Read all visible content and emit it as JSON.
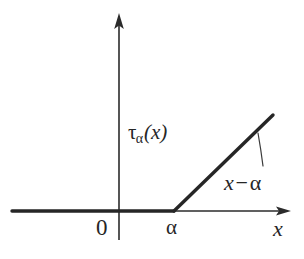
{
  "figure": {
    "kind": "hand-drawn mathematical plot",
    "background_color": "#ffffff",
    "ink_color": "#262626"
  },
  "labels": {
    "function_name": "τ",
    "function_subscript": "α",
    "function_argument": "(x)",
    "annotation_lhs": "x",
    "annotation_operator": "−",
    "annotation_rhs": "α",
    "origin": "0",
    "alpha_tick": "α",
    "x_axis": "x"
  },
  "chart_data": {
    "type": "line",
    "title": "",
    "xlabel": "x",
    "ylabel": "τα(x)",
    "grid": false,
    "legend": null,
    "axes": {
      "x_axis": {
        "from_px": [
          12,
          211
        ],
        "to_px": [
          291,
          211
        ],
        "arrow": "right",
        "origin_px": [
          119,
          211
        ]
      },
      "y_axis": {
        "from_px": [
          119,
          240
        ],
        "to_px": [
          119,
          13
        ],
        "arrow": "up",
        "origin_px": [
          119,
          211
        ]
      }
    },
    "series": [
      {
        "name": "τα(x)",
        "kind": "piecewise-linear",
        "stroke_width_px": 3.4,
        "points_px": [
          [
            12,
            211
          ],
          [
            174,
            211
          ],
          [
            273,
            115
          ]
        ],
        "segments": [
          {
            "label": "flat zero branch",
            "expression": "0",
            "domain": "x ≤ α",
            "from_px": [
              12,
              211
            ],
            "to_px": [
              174,
              211
            ]
          },
          {
            "label": "linear rising branch",
            "expression": "x − α",
            "domain": "x ≥ α",
            "from_px": [
              174,
              211
            ],
            "to_px": [
              273,
              115
            ]
          }
        ]
      }
    ],
    "annotations": [
      {
        "text": "x − α",
        "anchor_px": [
          224,
          172
        ],
        "leader_line_px": [
          [
            258,
            133
          ],
          [
            261,
            150
          ],
          [
            263,
            166
          ]
        ],
        "points_to": "linear rising branch"
      },
      {
        "text": "τα(x)",
        "anchor_px": [
          128,
          122
        ],
        "points_to": "curve name"
      }
    ],
    "ticks": [
      {
        "label": "0",
        "axis": "x",
        "value_px": 119,
        "is_origin": true
      },
      {
        "label": "α",
        "axis": "x",
        "value_px": 174,
        "is_origin": false
      }
    ]
  }
}
